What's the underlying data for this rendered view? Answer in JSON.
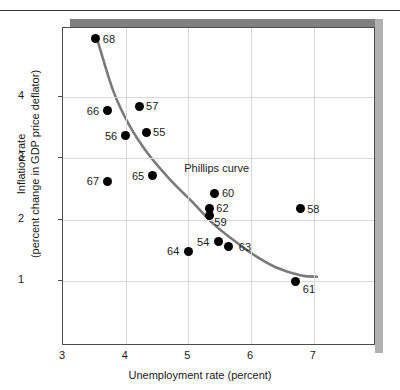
{
  "chart_data": {
    "type": "scatter",
    "title": "",
    "xlabel": "Unemployment rate (percent)",
    "ylabel_line1": "Inflation rate",
    "ylabel_line2": "(percent change in GDP price deflator)",
    "xlim": [
      3,
      7.5
    ],
    "ylim": [
      0.4,
      5.2
    ],
    "xticks": [
      3,
      4,
      5,
      6,
      7
    ],
    "yticks": [
      1,
      2,
      3,
      4
    ],
    "xtick_labels": [
      "3",
      "4",
      "5",
      "6",
      "7"
    ],
    "ytick_labels": [
      "1",
      "2",
      "3",
      "4"
    ],
    "grid": true,
    "legend": "none",
    "annotations": [
      {
        "text": "Phillips curve",
        "x": 4.95,
        "y": 2.83
      }
    ],
    "series": [
      {
        "name": "Unemployment vs inflation by year",
        "points": [
          {
            "label": "68",
            "x": 3.54,
            "y": 4.93,
            "label_dx": 7,
            "label_dy": -5
          },
          {
            "label": "66",
            "x": 3.73,
            "y": 3.76,
            "label_dx": -21,
            "label_dy": -5
          },
          {
            "label": "67",
            "x": 3.73,
            "y": 2.61,
            "label_dx": -21,
            "label_dy": -5
          },
          {
            "label": "56",
            "x": 4.02,
            "y": 3.35,
            "label_dx": -21,
            "label_dy": -5
          },
          {
            "label": "57",
            "x": 4.23,
            "y": 3.83,
            "label_dx": 7,
            "label_dy": -5
          },
          {
            "label": "55",
            "x": 4.34,
            "y": 3.41,
            "label_dx": 7,
            "label_dy": -5
          },
          {
            "label": "65",
            "x": 4.45,
            "y": 2.7,
            "label_dx": -21,
            "label_dy": -5
          },
          {
            "label": "64",
            "x": 5.01,
            "y": 1.47,
            "label_dx": -21,
            "label_dy": -5
          },
          {
            "label": "59",
            "x": 5.35,
            "y": 2.05,
            "label_dx": 5,
            "label_dy": 1
          },
          {
            "label": "62",
            "x": 5.35,
            "y": 2.16,
            "label_dx": 7,
            "label_dy": -6
          },
          {
            "label": "60",
            "x": 5.44,
            "y": 2.41,
            "label_dx": 7,
            "label_dy": -5
          },
          {
            "label": "54",
            "x": 5.49,
            "y": 1.62,
            "label_dx": -21,
            "label_dy": -5
          },
          {
            "label": "63",
            "x": 5.66,
            "y": 1.54,
            "label_dx": 10,
            "label_dy": -5
          },
          {
            "label": "61",
            "x": 6.73,
            "y": 0.97,
            "label_dx": 7,
            "label_dy": 2
          },
          {
            "label": "58",
            "x": 6.8,
            "y": 2.16,
            "label_dx": 7,
            "label_dy": -5
          }
        ]
      }
    ],
    "curve": {
      "name": "Phillips curve",
      "color": "#7a7a7a",
      "width": 2.6,
      "points": [
        {
          "x": 3.55,
          "y": 4.92
        },
        {
          "x": 3.8,
          "y": 4.1
        },
        {
          "x": 4.05,
          "y": 3.55
        },
        {
          "x": 4.35,
          "y": 3.08
        },
        {
          "x": 4.7,
          "y": 2.66
        },
        {
          "x": 5.05,
          "y": 2.3
        },
        {
          "x": 5.4,
          "y": 1.93
        },
        {
          "x": 5.7,
          "y": 1.68
        },
        {
          "x": 6.05,
          "y": 1.42
        },
        {
          "x": 6.4,
          "y": 1.22
        },
        {
          "x": 6.8,
          "y": 1.09
        },
        {
          "x": 7.05,
          "y": 1.07
        }
      ]
    }
  }
}
